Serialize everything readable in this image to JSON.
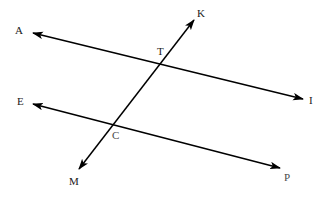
{
  "diagram": {
    "type": "geometry-line-diagram",
    "canvas": {
      "width": 330,
      "height": 207
    },
    "background_color": "#ffffff",
    "stroke_color": "#000000",
    "stroke_width": 1.5,
    "label_color": "#1a1a1a",
    "label_font_size": 11,
    "lines": [
      {
        "name": "line-AI",
        "from_label": "A",
        "to_label": "I",
        "x1": 33,
        "y1": 33,
        "x2": 303,
        "y2": 99,
        "arrow_start": true,
        "arrow_end": true
      },
      {
        "name": "line-EP",
        "from_label": "E",
        "to_label": "P",
        "x1": 33,
        "y1": 104,
        "x2": 280,
        "y2": 168,
        "arrow_start": true,
        "arrow_end": true
      },
      {
        "name": "line-KM",
        "from_label": "K",
        "to_label": "M",
        "x1": 194,
        "y1": 20,
        "x2": 79,
        "y2": 169,
        "arrow_start": true,
        "arrow_end": true
      }
    ],
    "intersections": [
      {
        "name": "point-T",
        "label": "T",
        "x": 161,
        "y": 64
      },
      {
        "name": "point-C",
        "label": "C",
        "x": 114,
        "y": 124
      }
    ],
    "labels": [
      {
        "name": "label-A",
        "text": "A",
        "x": 15,
        "y": 25,
        "faint": false
      },
      {
        "name": "label-K",
        "text": "K",
        "x": 197,
        "y": 8,
        "faint": false
      },
      {
        "name": "label-T",
        "text": "T",
        "x": 157,
        "y": 46,
        "faint": false
      },
      {
        "name": "label-I",
        "text": "I",
        "x": 309,
        "y": 95,
        "faint": false
      },
      {
        "name": "label-E",
        "text": "E",
        "x": 17,
        "y": 96,
        "faint": false
      },
      {
        "name": "label-C",
        "text": "C",
        "x": 112,
        "y": 130,
        "faint": true
      },
      {
        "name": "label-M",
        "text": "M",
        "x": 69,
        "y": 176,
        "faint": false
      },
      {
        "name": "label-P",
        "text": "P",
        "x": 284,
        "y": 172,
        "faint": true
      }
    ]
  }
}
